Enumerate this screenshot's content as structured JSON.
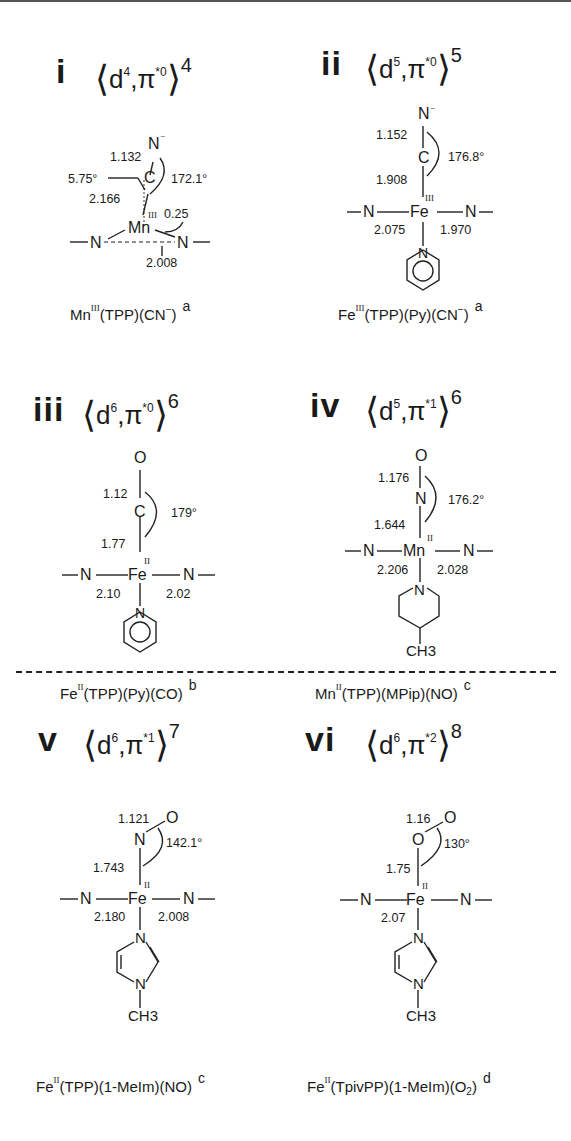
{
  "figure": {
    "panels": [
      {
        "id": "i",
        "numeral": "i",
        "config": {
          "d_count": "4",
          "pi_count": "*0",
          "total": "4"
        },
        "axial_top": "N",
        "axial_top_charge": "−",
        "axial_mid": "C",
        "metal": "Mn",
        "ox_state": "III",
        "bond_top": "1.132",
        "bond_metal_ligand": "2.166",
        "tilt_angle": "5.75°",
        "ligand_angle": "172.1°",
        "displacement": "0.25",
        "m_n_eq": "2.008",
        "caption": {
          "metal": "Mn",
          "ox": "III",
          "rest": "(TPP)(CN",
          "charge": "−",
          "close": ")",
          "ref": "a"
        }
      },
      {
        "id": "ii",
        "numeral": "ii",
        "config": {
          "d_count": "5",
          "pi_count": "*0",
          "total": "5"
        },
        "axial_top": "N",
        "axial_top_charge": "−",
        "axial_mid": "C",
        "metal": "Fe",
        "ox_state": "III",
        "bond_top": "1.152",
        "bond_metal_ligand": "1.908",
        "ligand_angle": "176.8°",
        "m_n_trans": "2.075",
        "m_n_eq": "1.970",
        "trans_ligand": "N",
        "caption": {
          "metal": "Fe",
          "ox": "III",
          "rest": "(TPP)(Py)(CN",
          "charge": "−",
          "close": ")",
          "ref": "a"
        }
      },
      {
        "id": "iii",
        "numeral": "iii",
        "config": {
          "d_count": "6",
          "pi_count": "*0",
          "total": "6"
        },
        "axial_top": "O",
        "axial_mid": "C",
        "metal": "Fe",
        "ox_state": "II",
        "bond_top": "1.12",
        "bond_metal_ligand": "1.77",
        "ligand_angle": "179°",
        "m_n_trans": "2.10",
        "m_n_eq": "2.02",
        "trans_ligand": "N",
        "caption": {
          "metal": "Fe",
          "ox": "II",
          "rest": "(TPP)(Py)(CO)",
          "ref": "b"
        }
      },
      {
        "id": "iv",
        "numeral": "iv",
        "config": {
          "d_count": "5",
          "pi_count": "*1",
          "total": "6"
        },
        "axial_top": "O",
        "axial_mid": "N",
        "metal": "Mn",
        "ox_state": "II",
        "bond_top": "1.176",
        "bond_metal_ligand": "1.644",
        "ligand_angle": "176.2°",
        "m_n_trans": "2.206",
        "m_n_eq": "2.028",
        "trans_ligand": "N",
        "methyl": "CH3",
        "caption": {
          "metal": "Mn",
          "ox": "II",
          "rest": "(TPP)(MPip)(NO)",
          "ref": "c"
        }
      },
      {
        "id": "v",
        "numeral": "v",
        "config": {
          "d_count": "6",
          "pi_count": "*1",
          "total": "7"
        },
        "axial_top": "O",
        "axial_mid": "N",
        "metal": "Fe",
        "ox_state": "II",
        "bond_top": "1.121",
        "bond_metal_ligand": "1.743",
        "ligand_angle": "142.1°",
        "m_n_trans": "2.180",
        "m_n_eq": "2.008",
        "trans_ligand_1": "N",
        "trans_ligand_2": "N",
        "methyl": "CH3",
        "caption": {
          "metal": "Fe",
          "ox": "II",
          "rest": "(TPP)(1-MeIm)(NO)",
          "ref": "c"
        }
      },
      {
        "id": "vi",
        "numeral": "vi",
        "config": {
          "d_count": "6",
          "pi_count": "*2",
          "total": "8"
        },
        "axial_top": "O",
        "axial_mid": "O",
        "metal": "Fe",
        "ox_state": "II",
        "bond_top": "1.16",
        "bond_metal_ligand": "1.75",
        "ligand_angle": "130°",
        "m_n_trans": "2.07",
        "trans_ligand_1": "N",
        "trans_ligand_2": "N",
        "methyl": "CH3",
        "caption": {
          "metal": "Fe",
          "ox": "II",
          "rest": "(TpivPP)(1-MeIm)(O",
          "sub": "2",
          "close": ")",
          "ref": "d"
        }
      }
    ],
    "common": {
      "eq_n": "N",
      "d_letter": "d",
      "pi_letter": "π",
      "lang": "⟨",
      "rang": "⟩",
      "comma": ","
    }
  }
}
